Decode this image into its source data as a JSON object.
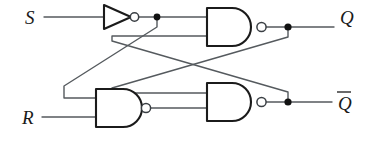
{
  "diagram": {
    "type": "logic-circuit-schematic",
    "background_color": "#ffffff",
    "wire_color": "#555a5e",
    "gate_outline_color": "#1b1b1b",
    "label_color": "#1a1a1a"
  },
  "inputs": [
    {
      "id": "s",
      "label": "S",
      "x": 25,
      "y": 24
    },
    {
      "id": "r",
      "label": "R",
      "x": 22,
      "y": 124
    }
  ],
  "outputs": [
    {
      "id": "q",
      "label": "Q",
      "x": 340,
      "y": 24,
      "overbar": false
    },
    {
      "id": "qbar",
      "label": "Q",
      "x": 338,
      "y": 113,
      "overbar": true
    }
  ],
  "gates": [
    {
      "id": "inverter",
      "type": "NOT",
      "label": "inverter-gate",
      "x": 104,
      "y": 5,
      "width": 30,
      "height": 24,
      "inverting_bubble": true
    },
    {
      "id": "nand-top",
      "type": "NAND",
      "label": "nand-gate-top",
      "x": 207,
      "y": 8,
      "width": 51,
      "height": 38,
      "inputs": 2,
      "inverting_bubble": true
    },
    {
      "id": "nand-bottom-left",
      "type": "NAND",
      "label": "nand-gate-bottom-left",
      "x": 96,
      "y": 89,
      "width": 46,
      "height": 38,
      "inputs": 2,
      "inverting_bubble": true
    },
    {
      "id": "nand-bottom-right",
      "type": "NAND",
      "label": "nand-gate-bottom-right",
      "x": 207,
      "y": 83,
      "width": 51,
      "height": 38,
      "inputs": 2,
      "inverting_bubble": true
    }
  ],
  "junctions": [
    {
      "id": "inverter-out-node",
      "x": 157,
      "y": 17
    },
    {
      "id": "q-node",
      "x": 288,
      "y": 27
    },
    {
      "id": "qbar-node",
      "x": 288,
      "y": 102
    }
  ],
  "nets": [
    {
      "id": "net-s-to-inverter",
      "from": "S",
      "to": "inverter input"
    },
    {
      "id": "net-inverter-to-nand-top",
      "from": "inverter output",
      "to": "nand-gate-top input 1"
    },
    {
      "id": "net-inverter-to-nand-bottom-left",
      "from": "inverter output node",
      "to": "nand-gate-bottom-left input 1"
    },
    {
      "id": "net-r-to-nand-bottom-left",
      "from": "R",
      "to": "nand-gate-bottom-left input 2"
    },
    {
      "id": "net-nand-bottom-left-to-nand-bottom-right",
      "from": "nand-gate-bottom-left output",
      "to": "nand-gate-bottom-right input 1"
    },
    {
      "id": "net-cross-q-to-bottom-right",
      "from": "Q node",
      "to": "nand-gate-bottom-right input 2"
    },
    {
      "id": "net-cross-qbar-to-top",
      "from": "Q-bar node",
      "to": "nand-gate-top input 2"
    },
    {
      "id": "net-nand-top-to-q",
      "from": "nand-gate-top output",
      "to": "Q"
    },
    {
      "id": "net-nand-bottom-right-to-qbar",
      "from": "nand-gate-bottom-right output",
      "to": "Q-bar"
    }
  ]
}
